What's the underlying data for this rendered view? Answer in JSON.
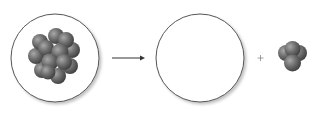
{
  "diagram": {
    "type": "nuclear-decay",
    "parent_nucleus": {
      "label": "parent nucleus",
      "nucleons_approx": 14,
      "color": "#6b6b6b"
    },
    "arrow": {
      "direction": "right"
    },
    "daughter_nucleus": {
      "label": "daughter nucleus",
      "shown_empty": true
    },
    "operator": "+",
    "emitted_particle": {
      "label": "alpha particle",
      "nucleons": 4,
      "color": "#6b6b6b"
    }
  },
  "colors": {
    "outline": "#555555",
    "sphere": "#6e6e6e",
    "background": "#ffffff"
  }
}
